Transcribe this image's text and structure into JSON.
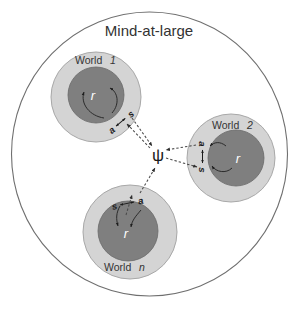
{
  "diagram": {
    "title": "Mind-at-large",
    "center_symbol": "ψ",
    "worlds": [
      {
        "id": "world-1",
        "label_prefix": "World",
        "label_index": "1",
        "inner_symbol": "r",
        "relation_left": "a",
        "relation_arrow": "↔",
        "relation_right": "s",
        "relation_order": "a-then-s"
      },
      {
        "id": "world-2",
        "label_prefix": "World",
        "label_index": "2",
        "inner_symbol": "r",
        "relation_left": "a",
        "relation_arrow": "↕",
        "relation_right": "s",
        "relation_order": "a-above-s"
      },
      {
        "id": "world-n",
        "label_prefix": "World",
        "label_index": "n",
        "inner_symbol": "r",
        "relation_left": "s",
        "relation_arrow": "↔",
        "relation_right": "a",
        "relation_order": "s-then-a"
      }
    ],
    "colors": {
      "boundary_stroke": "#6f6f6f",
      "world_outer_fill": "#d4d4d4",
      "world_inner_fill": "#7f7f7f",
      "link_stroke": "#4a4a4a",
      "text": "#2b2b2b",
      "inner_symbol_text": "#ffffff",
      "background": "#ffffff"
    }
  }
}
